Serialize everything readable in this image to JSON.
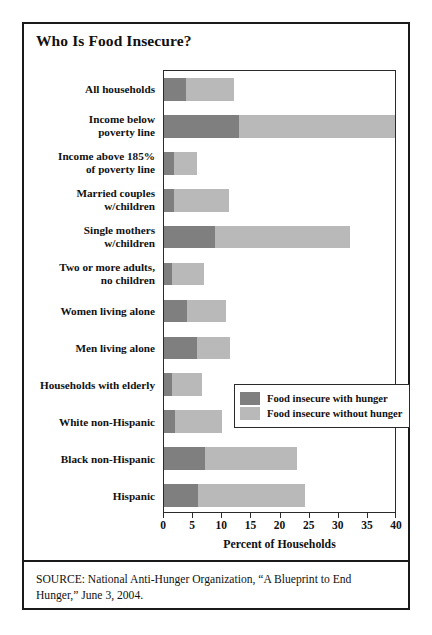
{
  "figure": {
    "title": "Who Is Food Insecure?",
    "source_note": "SOURCE: National Anti-Hunger Organization, “A Blueprint to End Hunger,” June 3, 2004."
  },
  "colors": {
    "with_hunger": "#7f7f7f",
    "without_hunger": "#b9b9b9",
    "frame": "#1a1a1a",
    "background": "#ffffff"
  },
  "legend": {
    "position": "inside-right-middle",
    "entries": [
      {
        "label": "Food insecure with hunger",
        "swatch": "with_hunger"
      },
      {
        "label": "Food insecure without hunger",
        "swatch": "without_hunger"
      }
    ]
  },
  "chart_data": {
    "type": "bar",
    "orientation": "horizontal",
    "stacked": true,
    "title": "Who Is Food Insecure?",
    "xlabel": "Percent of Households",
    "ylabel": "",
    "xlim": [
      0,
      40
    ],
    "xticks": [
      0,
      5,
      10,
      15,
      20,
      25,
      30,
      35,
      40
    ],
    "xtick_labels": [
      "0",
      "5",
      "10",
      "15",
      "20",
      "25",
      "30",
      "35",
      "40"
    ],
    "grid": false,
    "categories": [
      "All households",
      "Income below\npoverty line",
      "Income above 185%\nof poverty line",
      "Married couples\nw/children",
      "Single mothers\nw/children",
      "Two or more adults,\nno children",
      "Women living alone",
      "Men living alone",
      "Households with elderly",
      "White non-Hispanic",
      "Black non-Hispanic",
      "Hispanic"
    ],
    "series": [
      {
        "name": "Food insecure with hunger",
        "color": "#7f7f7f",
        "values": [
          3.8,
          13.0,
          1.7,
          1.7,
          8.8,
          1.4,
          4.0,
          5.7,
          1.3,
          1.9,
          7.0,
          5.9
        ]
      },
      {
        "name": "Food insecure without hunger",
        "color": "#b9b9b9",
        "values": [
          8.3,
          27.0,
          4.0,
          9.4,
          23.2,
          5.4,
          6.7,
          5.7,
          5.2,
          8.1,
          15.8,
          18.3
        ]
      }
    ],
    "totals": [
      12.1,
      40.0,
      5.7,
      11.1,
      32.0,
      6.8,
      10.7,
      11.4,
      6.5,
      10.0,
      22.8,
      24.2
    ]
  }
}
